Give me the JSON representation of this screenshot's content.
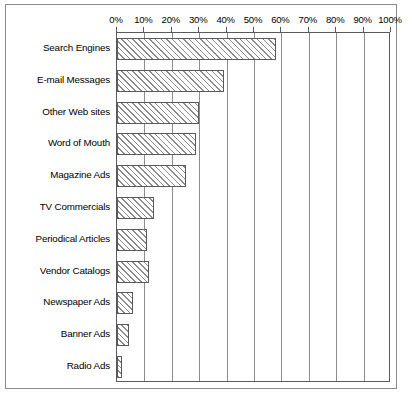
{
  "chart_data": {
    "type": "bar",
    "orientation": "horizontal",
    "title": "",
    "subtitle": "",
    "xlabel": "",
    "ylabel": "",
    "xlim": [
      0,
      100
    ],
    "grid": true,
    "legend": false,
    "legend_position": "none",
    "axis_position": "top",
    "tick_labels": [
      "0%",
      "10%",
      "20%",
      "30%",
      "40%",
      "50%",
      "60%",
      "70%",
      "80%",
      "90%",
      "100%"
    ],
    "ticks": [
      0,
      10,
      20,
      30,
      40,
      50,
      60,
      70,
      80,
      90,
      100
    ],
    "categories": [
      "Search Engines",
      "E-mail Messages",
      "Other Web sites",
      "Word of Mouth",
      "Magazine Ads",
      "TV Commercials",
      "Periodical Articles",
      "Vendor Catalogs",
      "Newspaper Ads",
      "Banner Ads",
      "Radio Ads"
    ],
    "values": [
      58,
      39,
      30,
      29,
      25,
      13.5,
      11,
      11.5,
      6,
      4.5,
      2
    ],
    "colors": {
      "bar_fill": "#ffffff",
      "bar_hatch": "#8c8c8c",
      "bar_edge": "#5a5a5a",
      "gridline": "#8d8d8d",
      "frame": "#8a8a8a",
      "text": "#000000",
      "background": "#ffffff"
    }
  }
}
